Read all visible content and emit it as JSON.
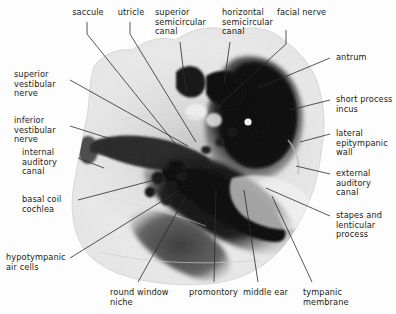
{
  "figure": {
    "modality": "CT",
    "background_color": "#fdfdfd",
    "ink_color": "#1a1a1a",
    "leader_line_color": "#2b2b2b"
  },
  "labels": {
    "saccule": "saccule",
    "utricle": "utricle",
    "superior_semicircular_canal": "superior\nsemicircular\ncanal",
    "horizontal_semicircular_canal": "horizontal\nsemicircular\ncanal",
    "facial_nerve": "facial nerve",
    "antrum": "antrum",
    "short_process_incus": "short process\nincus",
    "lateral_epitympanic_wall": "lateral\nepitympanic\nwall",
    "external_auditory_canal": "external\nauditory\ncanal",
    "stapes_and_lenticular_process": "stapes and\nlenticular\nprocess",
    "tympanic_membrane": "tympanic\nmembrane",
    "middle_ear": "middle ear",
    "promontory": "promontory",
    "round_window_niche": "round window\nniche",
    "hypotympanic_air_cells": "hypotympanic\nair cells",
    "basal_coil_cochlea": "basal coil\ncochlea",
    "internal_auditory_canal": "internal\nauditory\ncanal",
    "inferior_vestibular_nerve": "inferior\nvestibular\nnerve",
    "superior_vestibular_nerve": "superior\nvestibular\nnerve"
  }
}
